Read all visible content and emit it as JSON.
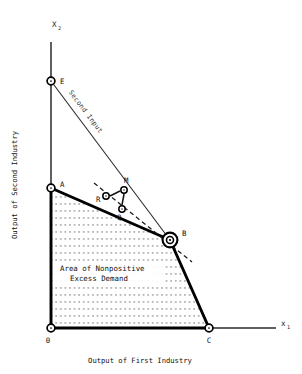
{
  "figure": {
    "title_visible": false,
    "axes": {
      "x_axis_label": "x",
      "x_axis_sub": "1",
      "y_axis_label": "X",
      "y_axis_sub": "2",
      "x_caption": "Output of First Industry",
      "y_caption": "Output of Second Industry",
      "origin_label": "0"
    },
    "annotations": {
      "second_input": "Second Input",
      "area_line1": "Area of Nonpositive",
      "area_line2": "Excess Demand"
    },
    "points": [
      {
        "id": "E",
        "label": "E",
        "x": 51,
        "y": 81,
        "marker": "circle",
        "label_dx": 8,
        "label_dy": 2
      },
      {
        "id": "A",
        "label": "A",
        "x": 51,
        "y": 188,
        "marker": "circle",
        "label_dx": 8,
        "label_dy": -2
      },
      {
        "id": "R",
        "label": "R",
        "x": 106,
        "y": 196,
        "marker": "circle",
        "label_dx": -10,
        "label_dy": 5
      },
      {
        "id": "M",
        "label": "M",
        "x": 124,
        "y": 190,
        "marker": "circle",
        "label_dx": 1,
        "label_dy": -7
      },
      {
        "id": "Q",
        "label": "Q",
        "x": 122,
        "y": 209,
        "marker": "circle",
        "label_dx": -4,
        "label_dy": 11
      },
      {
        "id": "B",
        "label": "B",
        "x": 170,
        "y": 240,
        "marker": "double",
        "label_dx": 12,
        "label_dy": -6
      },
      {
        "id": "C",
        "label": "C",
        "x": 209,
        "y": 328,
        "marker": "circle",
        "label_dx": 0,
        "label_dy": 13
      },
      {
        "id": "O",
        "label": "0",
        "x": 51,
        "y": 328,
        "marker": "circle",
        "label_dx": -3,
        "label_dy": 14
      }
    ],
    "colors": {
      "ink": "#000000",
      "thin_line": "#333333",
      "dotted_fill": "#444444"
    },
    "legend_notes": {
      "frontier": "A-B-C thick production possibility frontier",
      "second_input": "E-B thin second input constraint line",
      "price_line": "dashed price line through R, Q and B"
    }
  }
}
